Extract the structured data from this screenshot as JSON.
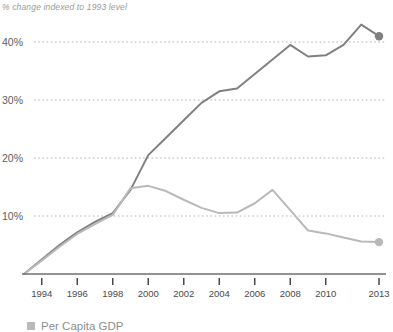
{
  "chart_data": {
    "type": "line",
    "title": "",
    "subtitle": "",
    "axis_note": "% change indexed to 1993 level",
    "xlabel": "",
    "ylabel": "",
    "grid": "horizontal-dotted",
    "legend_position": "bottom-left",
    "xlim": [
      1993,
      2013
    ],
    "ylim": [
      0,
      45
    ],
    "yticks": [
      10,
      20,
      30,
      40
    ],
    "ytick_labels": [
      "10%",
      "20%",
      "30%",
      "40%"
    ],
    "xticks": [
      1994,
      1996,
      1998,
      2000,
      2002,
      2004,
      2006,
      2008,
      2010,
      2013
    ],
    "xtick_labels": [
      "1994",
      "1996",
      "1998",
      "2000",
      "2002",
      "2004",
      "2006",
      "2008",
      "2010",
      "2013"
    ],
    "x": [
      1993,
      1994,
      1995,
      1996,
      1997,
      1998,
      1999,
      2000,
      2001,
      2002,
      2003,
      2004,
      2005,
      2006,
      2007,
      2008,
      2009,
      2010,
      2011,
      2012,
      2013
    ],
    "series": [
      {
        "name": "dark-series",
        "color": "#808080",
        "endpoint_marker": true,
        "values": [
          0,
          2.5,
          5.0,
          7.2,
          9.0,
          10.5,
          14.5,
          20.5,
          23.5,
          26.5,
          29.5,
          31.5,
          32.0,
          34.5,
          37.0,
          39.5,
          37.5,
          37.7,
          39.5,
          43.0,
          41.0
        ]
      },
      {
        "name": "light-series",
        "color": "#b9b9b9",
        "endpoint_marker": true,
        "values": [
          0,
          2.3,
          4.7,
          6.9,
          8.6,
          10.2,
          14.8,
          15.2,
          14.3,
          12.8,
          11.4,
          10.5,
          10.6,
          12.2,
          14.5,
          11.0,
          7.5,
          7.0,
          6.3,
          5.6,
          5.5
        ]
      }
    ],
    "legend": [
      {
        "label": "Per Capita GDP",
        "color": "#b9b9b9"
      }
    ],
    "colors": {
      "dark_line": "#808080",
      "light_line": "#b9b9b9",
      "gridline": "#a9a9a9",
      "axis": "#6e6e6e",
      "note_text": "#9a9a9a",
      "tick_text": "#4a4a4a"
    }
  }
}
